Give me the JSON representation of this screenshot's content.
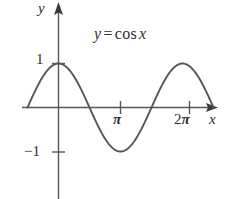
{
  "figure": {
    "background_color": "#ffffff",
    "ink_color": "#55555c",
    "text_color": "#2e2e32"
  },
  "labels": {
    "equation_y": "y",
    "equation_operator": "=",
    "equation_function": "cos",
    "equation_x": "x",
    "y_axis": "y",
    "x_axis": "x",
    "tick_one": "1",
    "tick_negative_one": "−1",
    "tick_pi": "π",
    "tick_two_pi_number": "2",
    "tick_two_pi_symbol": "π"
  },
  "chart_data": {
    "type": "line",
    "xlabel": "x",
    "ylabel": "y",
    "function": "cos",
    "amplitude": 1,
    "period": 6.283185307179586,
    "xlim": [
      -0.5,
      2.5
    ],
    "ylim": [
      -1.35,
      1.6
    ],
    "x_unit": "pi",
    "grid": false,
    "legend": false,
    "axes": {
      "x_axis_arrow": true,
      "y_axis_arrow": true,
      "x_ticks": [
        {
          "value": 3.141592653589793,
          "label": "π"
        },
        {
          "value": 6.283185307179586,
          "label": "2π"
        }
      ],
      "y_ticks": [
        {
          "value": 1,
          "label": "1"
        },
        {
          "value": -1,
          "label": "−1"
        }
      ]
    },
    "x": [
      -0.4712,
      -0.3142,
      -0.1571,
      0.0,
      0.3927,
      0.7854,
      1.1781,
      1.5708,
      1.9635,
      2.3562,
      2.7489,
      3.1416,
      3.5343,
      3.927,
      4.3197,
      4.7124,
      5.1051,
      5.4978,
      5.8905,
      6.2832,
      6.6759,
      7.0686,
      7.4613,
      7.854
    ],
    "y": [
      0.891,
      0.9511,
      0.9877,
      1.0,
      0.9239,
      0.7071,
      0.3827,
      0.0,
      -0.3827,
      -0.7071,
      -0.9239,
      -1.0,
      -0.9239,
      -0.7071,
      -0.3827,
      0.0,
      0.3827,
      0.7071,
      0.9239,
      1.0,
      0.9239,
      0.7071,
      0.3827,
      0.0
    ]
  }
}
